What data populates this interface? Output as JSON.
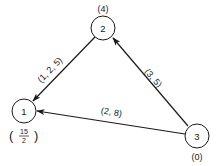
{
  "diagram": {
    "type": "directed-graph",
    "nodes": [
      {
        "id": "1",
        "label": "1",
        "annotation": "15/2",
        "annotation_num": "15",
        "annotation_den": "2"
      },
      {
        "id": "2",
        "label": "2",
        "annotation": "(4)"
      },
      {
        "id": "3",
        "label": "3",
        "annotation": "(0)"
      }
    ],
    "edges": [
      {
        "from": "2",
        "to": "1",
        "label": "(1, 2, 5)"
      },
      {
        "from": "3",
        "to": "2",
        "label": "(3, 5)"
      },
      {
        "from": "3",
        "to": "1",
        "label": "(2, 8)"
      }
    ],
    "colors": {
      "stroke": "#1a1a1a",
      "background": "#ffffff"
    }
  }
}
